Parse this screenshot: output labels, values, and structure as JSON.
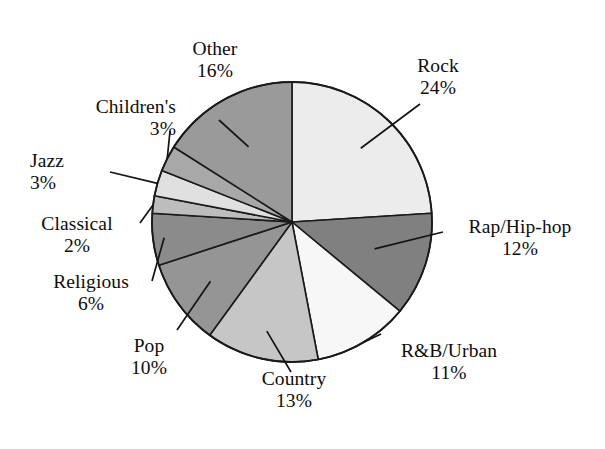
{
  "chart_data": {
    "type": "pie",
    "title": "",
    "subtitle": "",
    "xlabel": "",
    "ylabel": "",
    "legend_position": "none",
    "grid": false,
    "labels_outside": true,
    "units": "percent",
    "total": 100,
    "categories": [
      "Rock",
      "Rap/Hip-hop",
      "R&B/Urban",
      "Country",
      "Pop",
      "Religious",
      "Classical",
      "Jazz",
      "Children's",
      "Other"
    ],
    "values": [
      24,
      12,
      11,
      13,
      10,
      6,
      2,
      3,
      3,
      16
    ],
    "slices": [
      {
        "name": "Rock",
        "value": 24,
        "value_text": "24%",
        "color": "#ececec",
        "start_angle": 0,
        "end_angle": 86.4
      },
      {
        "name": "Rap/Hip-hop",
        "value": 12,
        "value_text": "12%",
        "color": "#808080",
        "start_angle": 86.4,
        "end_angle": 129.6
      },
      {
        "name": "R&B/Urban",
        "value": 11,
        "value_text": "11%",
        "color": "#f7f7f7",
        "start_angle": 129.6,
        "end_angle": 169.2
      },
      {
        "name": "Country",
        "value": 13,
        "value_text": "13%",
        "color": "#c6c6c6",
        "start_angle": 169.2,
        "end_angle": 216.0
      },
      {
        "name": "Pop",
        "value": 10,
        "value_text": "10%",
        "color": "#959595",
        "start_angle": 216.0,
        "end_angle": 252.0
      },
      {
        "name": "Religious",
        "value": 6,
        "value_text": "6%",
        "color": "#8b8b8b",
        "start_angle": 252.0,
        "end_angle": 273.6
      },
      {
        "name": "Classical",
        "value": 2,
        "value_text": "2%",
        "color": "#bdbdbd",
        "start_angle": 273.6,
        "end_angle": 280.8
      },
      {
        "name": "Jazz",
        "value": 3,
        "value_text": "3%",
        "color": "#e0e0e0",
        "start_angle": 280.8,
        "end_angle": 291.6
      },
      {
        "name": "Children's",
        "value": 3,
        "value_text": "3%",
        "color": "#a8a8a8",
        "start_angle": 291.6,
        "end_angle": 302.4
      },
      {
        "name": "Other",
        "value": 16,
        "value_text": "16%",
        "color": "#9a9a9a",
        "start_angle": 302.4,
        "end_angle": 360.0
      }
    ]
  },
  "labels": {
    "rock": {
      "name": "Rock",
      "value": "24%"
    },
    "rap": {
      "name": "Rap/Hip-hop",
      "value": "12%"
    },
    "rnb": {
      "name": "R&B/Urban",
      "value": "11%"
    },
    "country": {
      "name": "Country",
      "value": "13%"
    },
    "pop": {
      "name": "Pop",
      "value": "10%"
    },
    "religious": {
      "name": "Religious",
      "value": "6%"
    },
    "classical": {
      "name": "Classical",
      "value": "2%"
    },
    "jazz": {
      "name": "Jazz",
      "value": "3%"
    },
    "childrens": {
      "name": "Children's",
      "value": "3%"
    },
    "other": {
      "name": "Other",
      "value": "16%"
    }
  },
  "style": {
    "background": "#ffffff",
    "outline": "#1a1a1a",
    "leader_line": "#141414"
  }
}
